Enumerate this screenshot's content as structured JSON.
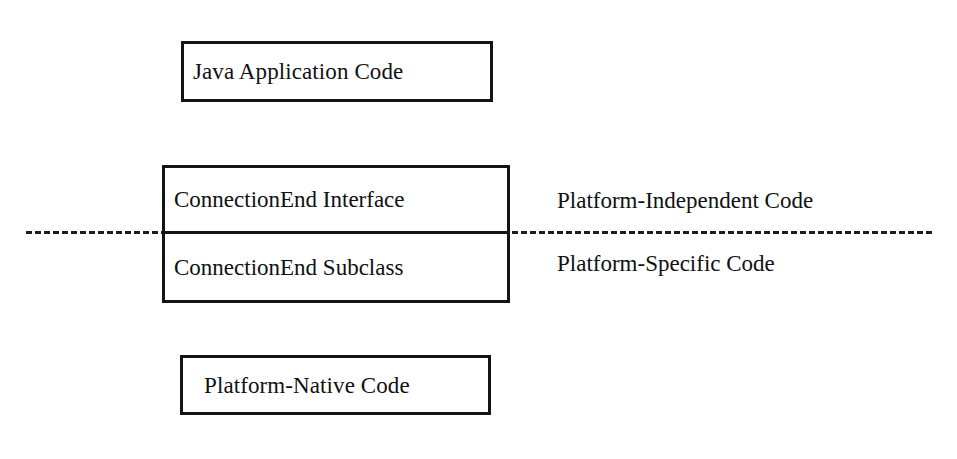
{
  "diagram": {
    "background_color": "#ffffff",
    "line_color": "#141414",
    "text_color": "#111111",
    "boxes": {
      "application": {
        "label": "Java Application Code"
      },
      "connection_end_interface": {
        "label": "ConnectionEnd Interface"
      },
      "connection_end_subclass": {
        "label": "ConnectionEnd Subclass"
      },
      "platform_native": {
        "label": "Platform-Native Code"
      }
    },
    "annotations": {
      "above_line": "Platform-Independent Code",
      "below_line": "Platform-Specific Code"
    },
    "divider": {
      "style": "dashed",
      "color": "#1e1e1e"
    }
  }
}
